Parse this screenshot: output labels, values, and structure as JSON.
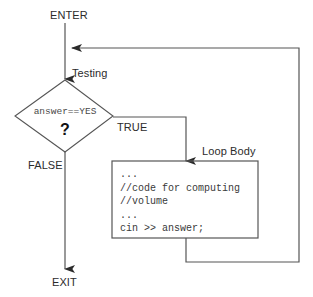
{
  "diagram": {
    "type": "flowchart",
    "colors": {
      "stroke": "#555555",
      "text": "#2b2b2b",
      "code_text": "#3a3a3a",
      "background": "#ffffff"
    },
    "labels": {
      "enter": "ENTER",
      "testing": "Testing",
      "true_branch": "TRUE",
      "false_branch": "FALSE",
      "loop_body": "Loop Body",
      "exit": "EXIT"
    },
    "decision": {
      "condition": "answer==YES",
      "question_mark": "?"
    },
    "loop_body_code": [
      "...",
      "//code for computing",
      "//volume",
      "...",
      "cin >> answer;"
    ],
    "edges": [
      {
        "name": "enter-to-decision",
        "from": "ENTER",
        "to": "Testing"
      },
      {
        "name": "decision-true-to-body",
        "from": "answer==YES",
        "to": "Loop Body",
        "label": "TRUE"
      },
      {
        "name": "decision-false-to-exit",
        "from": "answer==YES",
        "to": "EXIT",
        "label": "FALSE"
      },
      {
        "name": "body-back-to-decision",
        "from": "Loop Body",
        "to": "Testing"
      }
    ]
  }
}
